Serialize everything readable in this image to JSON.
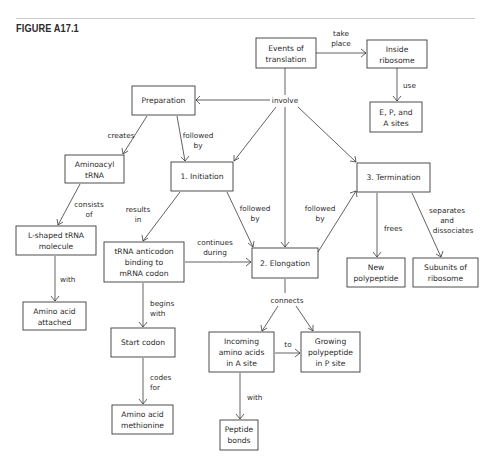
{
  "figure": {
    "title": "FIGURE A17.1"
  },
  "nodes": {
    "events": {
      "lines": [
        "Events of",
        "translation"
      ]
    },
    "inside": {
      "lines": [
        "Inside",
        "ribosome"
      ]
    },
    "sites": {
      "lines": [
        "E, P, and",
        "A sites"
      ]
    },
    "preparation": {
      "lines": [
        "Preparation"
      ]
    },
    "aminoacyl": {
      "lines": [
        "Aminoacyl",
        "tRNA"
      ]
    },
    "lshaped": {
      "lines": [
        "L-shaped tRNA",
        "molecule"
      ]
    },
    "attached": {
      "lines": [
        "Amino acid",
        "attached"
      ]
    },
    "initiation": {
      "lines": [
        "1. Initiation"
      ]
    },
    "anticodon": {
      "lines": [
        "tRNA anticodon",
        "binding to",
        "mRNA codon"
      ]
    },
    "startcodon": {
      "lines": [
        "Start codon"
      ]
    },
    "methionine": {
      "lines": [
        "Amino acid",
        "methionine"
      ]
    },
    "elongation": {
      "lines": [
        "2. Elongation"
      ]
    },
    "incoming": {
      "lines": [
        "Incoming",
        "amino acids",
        "in A site"
      ]
    },
    "growing": {
      "lines": [
        "Growing",
        "polypeptide",
        "in P site"
      ]
    },
    "peptide": {
      "lines": [
        "Peptide",
        "bonds"
      ]
    },
    "termination": {
      "lines": [
        "3. Termination"
      ]
    },
    "newpoly": {
      "lines": [
        "New",
        "polypeptide"
      ]
    },
    "subunits": {
      "lines": [
        "Subunits of",
        "ribosome"
      ]
    }
  },
  "links": {
    "take_place": {
      "lines": [
        "take",
        "place"
      ]
    },
    "use": {
      "lines": [
        "use"
      ]
    },
    "involve": {
      "lines": [
        "involve"
      ]
    },
    "creates": {
      "lines": [
        "creates"
      ]
    },
    "followed_by_1": {
      "lines": [
        "followed",
        "by"
      ]
    },
    "consists_of": {
      "lines": [
        "consists",
        "of"
      ]
    },
    "with_1": {
      "lines": [
        "with"
      ]
    },
    "results_in": {
      "lines": [
        "results",
        "in"
      ]
    },
    "followed_by_2": {
      "lines": [
        "followed",
        "by"
      ]
    },
    "followed_by_3": {
      "lines": [
        "followed",
        "by"
      ]
    },
    "continues_during": {
      "lines": [
        "continues",
        "during"
      ]
    },
    "begins_with": {
      "lines": [
        "begins",
        "with"
      ]
    },
    "codes_for": {
      "lines": [
        "codes",
        "for"
      ]
    },
    "frees": {
      "lines": [
        "frees"
      ]
    },
    "separates": {
      "lines": [
        "separates",
        "and",
        "dissociates"
      ]
    },
    "connects": {
      "lines": [
        "connects"
      ]
    },
    "to": {
      "lines": [
        "to"
      ]
    },
    "with_2": {
      "lines": [
        "with"
      ]
    }
  }
}
